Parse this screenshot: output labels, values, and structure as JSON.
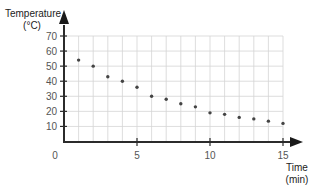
{
  "chart_data": {
    "type": "scatter",
    "title": "",
    "xlabel": "Time\n(min)",
    "ylabel": "Temperature\n(°C)",
    "xlabel_lines": [
      "Time",
      "(min)"
    ],
    "ylabel_lines": [
      "Temperature",
      "(°C)"
    ],
    "xlim": [
      0,
      15
    ],
    "ylim": [
      0,
      70
    ],
    "x_ticks": [
      0,
      5,
      10,
      15
    ],
    "y_ticks": [
      10,
      20,
      30,
      40,
      50,
      60,
      70
    ],
    "x_tick_labels": [
      "0",
      "5",
      "10",
      "15"
    ],
    "y_tick_labels": [
      "10",
      "20",
      "30",
      "40",
      "50",
      "60",
      "70"
    ],
    "grid": true,
    "grid_x_step": 1,
    "grid_y_step": 10,
    "legend": null,
    "series": [
      {
        "name": "Temperature",
        "x": [
          1,
          2,
          3,
          4,
          5,
          6,
          7,
          8,
          9,
          10,
          11,
          12,
          13,
          14,
          15
        ],
        "values": [
          54,
          50,
          43,
          40,
          36,
          30,
          28,
          25,
          23,
          19,
          18,
          16,
          15,
          13.5,
          12
        ]
      }
    ]
  },
  "colors": {
    "axis": "#2b2b2b",
    "grid": "#d4d4d4",
    "point": "#444444",
    "text": "#333333"
  }
}
